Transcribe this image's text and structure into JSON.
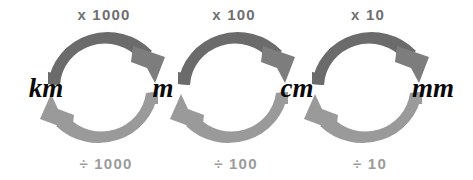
{
  "diagram": {
    "type": "conversion-cycle",
    "background_color": "#ffffff",
    "units": [
      {
        "id": "km",
        "label": "km",
        "name": "kilometre",
        "x": 46,
        "y": 88
      },
      {
        "id": "m",
        "label": "m",
        "name": "metre",
        "x": 163,
        "y": 88
      },
      {
        "id": "cm",
        "label": "cm",
        "name": "centimetre",
        "x": 297,
        "y": 88
      },
      {
        "id": "mm",
        "label": "mm",
        "name": "millimetre",
        "x": 433,
        "y": 88
      }
    ],
    "conversions": [
      {
        "from": "km",
        "to": "m",
        "multiply_label": "x 1000",
        "divide_label": "÷ 1000",
        "factor": 1000,
        "center_x": 104,
        "center_y": 88,
        "radius": 62,
        "multiply_label_x": 104,
        "multiply_label_y": 14,
        "divide_label_x": 106,
        "divide_label_y": 163
      },
      {
        "from": "m",
        "to": "cm",
        "multiply_label": "x 100",
        "divide_label": "÷ 100",
        "factor": 100,
        "center_x": 234,
        "center_y": 88,
        "radius": 62,
        "multiply_label_x": 234,
        "multiply_label_y": 14,
        "divide_label_x": 236,
        "divide_label_y": 163
      },
      {
        "from": "cm",
        "to": "mm",
        "multiply_label": "x 10",
        "divide_label": "÷ 10",
        "factor": 10,
        "center_x": 368,
        "center_y": 88,
        "radius": 62,
        "multiply_label_x": 368,
        "multiply_label_y": 14,
        "divide_label_x": 370,
        "divide_label_y": 163
      }
    ],
    "colors": {
      "arc_multiply": "#6b6b6b",
      "arc_divide": "#9a9a9a",
      "label_multiply": "#6f6f6f",
      "label_divide": "#9b9b9b",
      "unit_text": "#0a0a0a",
      "background": "#ffffff"
    },
    "arrow_directions": {
      "top": "clockwise-rightward",
      "bottom": "counterclockwise-leftward"
    }
  }
}
